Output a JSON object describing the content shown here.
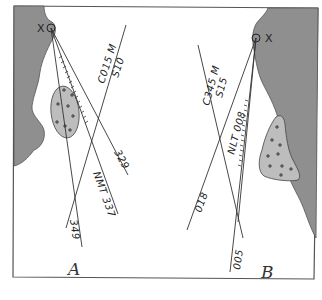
{
  "figure": {
    "panels": [
      {
        "id": "A",
        "label": "A",
        "object_label": "X",
        "coast_side": "left",
        "bearings": [
          {
            "label": "349",
            "value": 349
          },
          {
            "label": "NMT 337",
            "value": 337,
            "type": "clearing",
            "qualifier": "NMT"
          },
          {
            "label": "329",
            "value": 329
          },
          {
            "label": "C015 M",
            "value": 15,
            "type": "course"
          },
          {
            "label": "S10",
            "value": 10,
            "type": "speed"
          }
        ]
      },
      {
        "id": "B",
        "label": "B",
        "object_label": "X",
        "coast_side": "right",
        "bearings": [
          {
            "label": "005",
            "value": 5
          },
          {
            "label": "NLT 008",
            "value": 8,
            "type": "clearing",
            "qualifier": "NLT"
          },
          {
            "label": "018",
            "value": 18
          },
          {
            "label": "C345 M",
            "value": 345,
            "type": "course"
          },
          {
            "label": "S15",
            "value": 15,
            "type": "speed"
          }
        ]
      }
    ],
    "colors": {
      "land": "#8f8f8f",
      "shoal": "#bdbdbd",
      "line": "#333333",
      "background": "#ffffff"
    }
  },
  "labels": {
    "a_panel": "A",
    "b_panel": "B",
    "a_x": "X",
    "b_x": "X",
    "a_course": "C015 M",
    "a_speed": "S10",
    "a_b329": "329",
    "a_nmt": "NMT 337",
    "a_b349": "349",
    "b_course": "C345 M",
    "b_speed": "S15",
    "b_nlt": "NLT 008",
    "b_b018": "018",
    "b_b005": "005"
  }
}
